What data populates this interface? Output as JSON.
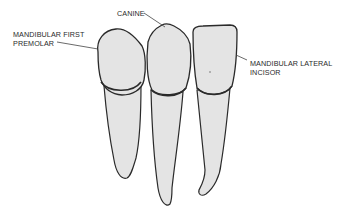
{
  "diagram": {
    "type": "dental-anatomy-illustration",
    "colors": {
      "background": "#ffffff",
      "tooth_fill": "#e4e4e4",
      "outline": "#2a2a2a",
      "leader_line": "#444444",
      "label_text": "#2a2a2a"
    },
    "labels": {
      "premolar": {
        "line1": "MANDIBULAR FIRST",
        "line2": "PREMOLAR"
      },
      "canine": {
        "line1": "CANINE"
      },
      "incisor": {
        "line1": "MANDIBULAR LATERAL",
        "line2": "INCISOR"
      }
    },
    "teeth": [
      {
        "name": "Mandibular first premolar",
        "position": "left"
      },
      {
        "name": "Canine",
        "position": "center"
      },
      {
        "name": "Mandibular lateral incisor",
        "position": "right"
      }
    ]
  }
}
